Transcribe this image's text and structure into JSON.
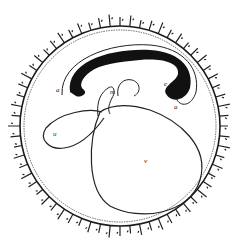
{
  "diagram": {
    "type": "embryology-section",
    "labels": {
      "a_left": "a",
      "a_right": "a",
      "i": "i",
      "e": "e",
      "m": "m",
      "u": "u",
      "v": "v"
    },
    "colors": {
      "ink": "#1a1a1a",
      "embryo_fill": "#111111",
      "background": "#ffffff"
    }
  }
}
